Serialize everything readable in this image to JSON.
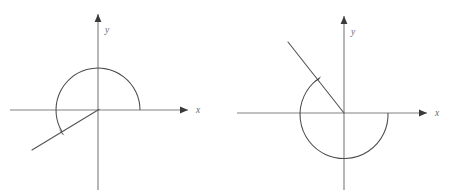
{
  "figure": {
    "background_color": "#ffffff",
    "axis_color": "#808286",
    "curve_color": "#4c4c4e",
    "ray_color": "#56565a",
    "label_color": "#6a6a6e",
    "arrow_color": "#2b2b2d",
    "width": 458,
    "height": 195
  },
  "panels": [
    {
      "id": "left",
      "name": "negative-angle-diagram",
      "origin": {
        "x": 98,
        "y": 110
      },
      "x_axis": {
        "label": "x",
        "start_x": 10,
        "end_x": 188,
        "label_x": 196,
        "label_y": 113
      },
      "y_axis": {
        "label": "y",
        "top_y": 14,
        "bottom_y": 190,
        "label_x": 105,
        "label_y": 33
      },
      "terminal_ray": {
        "from_x": 98,
        "from_y": 110,
        "to_x": 32,
        "to_y": 150
      },
      "rotation_arc": {
        "radius": 42,
        "direction": "clockwise",
        "start_angle_deg": 0,
        "end_angle_deg": 211,
        "sweep_description": "from positive x-axis counterclockwise over the top and down into the third quadrant",
        "arrowhead_at": "terminal"
      }
    },
    {
      "id": "right",
      "name": "positive-angle-diagram",
      "origin": {
        "x": 115,
        "y": 113
      },
      "x_axis": {
        "label": "x",
        "start_x": 8,
        "end_x": 198,
        "label_x": 206,
        "label_y": 116
      },
      "y_axis": {
        "label": "y",
        "top_y": 16,
        "bottom_y": 190,
        "label_x": 122,
        "label_y": 35
      },
      "terminal_ray": {
        "from_x": 115,
        "from_y": 113,
        "to_x": 59,
        "to_y": 42
      },
      "rotation_arc": {
        "radius": 44,
        "direction": "counterclockwise",
        "start_angle_deg": 0,
        "end_angle_deg": 232,
        "sweep_description": "from positive x-axis clockwise under the bottom and up into the second quadrant",
        "arrowhead_at": "terminal"
      }
    }
  ],
  "labels": {
    "x_axis": "x",
    "y_axis": "y"
  }
}
